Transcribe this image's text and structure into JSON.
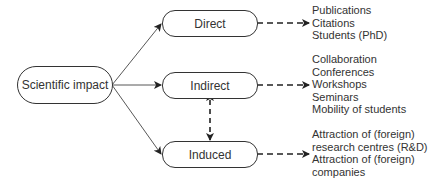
{
  "diagram": {
    "root": {
      "label": "Scientific impact"
    },
    "categories": [
      {
        "id": "direct",
        "label": "Direct",
        "items": [
          "Publications",
          "Citations",
          "Students (PhD)"
        ]
      },
      {
        "id": "indirect",
        "label": "Indirect",
        "items": [
          "Collaboration",
          "Conferences",
          "Workshops",
          "Seminars",
          "Mobility of students"
        ]
      },
      {
        "id": "induced",
        "label": "Induced",
        "items": [
          "Attraction of (foreign)",
          "research centres (R&D)",
          "Attraction of (foreign)",
          "companies"
        ]
      }
    ],
    "edges": [
      {
        "from": "root",
        "to": "direct",
        "style": "solid"
      },
      {
        "from": "root",
        "to": "indirect",
        "style": "solid"
      },
      {
        "from": "root",
        "to": "induced",
        "style": "solid"
      },
      {
        "from": "direct",
        "to": "direct-items",
        "style": "dashed"
      },
      {
        "from": "indirect",
        "to": "indirect-items",
        "style": "dashed"
      },
      {
        "from": "induced",
        "to": "induced-items",
        "style": "dashed"
      },
      {
        "from": "indirect",
        "to": "induced",
        "style": "dashed-bidirectional"
      }
    ],
    "colors": {
      "line": "#333333",
      "background": "#ffffff"
    }
  }
}
